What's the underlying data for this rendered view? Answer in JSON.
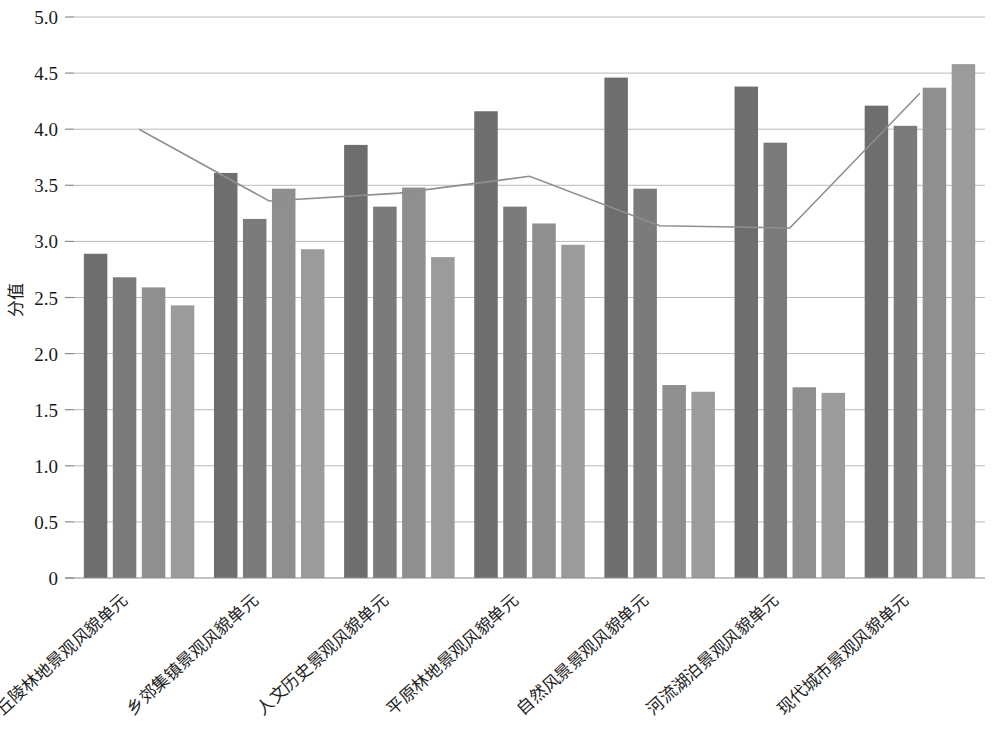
{
  "chart_data": {
    "type": "bar",
    "title": "",
    "subtitle": "",
    "xlabel": "",
    "ylabel": "分值",
    "ylim": [
      0,
      5.0
    ],
    "y_ticks": [
      "0",
      "0.5",
      "1.0",
      "1.5",
      "2.0",
      "2.5",
      "3.0",
      "3.5",
      "4.0",
      "4.5",
      "5.0"
    ],
    "y_tick_values": [
      0,
      0.5,
      1.0,
      1.5,
      2.0,
      2.5,
      3.0,
      3.5,
      4.0,
      4.5,
      5.0
    ],
    "grid": true,
    "legend_position": "none",
    "categories": [
      "丘陵林地景观风貌单元",
      "乡郊集镇景观风貌单元",
      "人文历史景观风貌单元",
      "平原林地景观风貌单元",
      "自然风景景观风貌单元",
      "河流湖泊景观风貌单元",
      "现代城市景观风貌单元"
    ],
    "series": [
      {
        "name": "系列1",
        "color": "#6e6e6e",
        "values": [
          2.89,
          3.61,
          3.86,
          4.16,
          4.46,
          4.38,
          4.21
        ]
      },
      {
        "name": "系列2",
        "color": "#7b7b7b",
        "values": [
          2.68,
          3.2,
          3.31,
          3.31,
          3.47,
          3.88,
          4.03
        ]
      },
      {
        "name": "系列3",
        "color": "#8f8f8f",
        "values": [
          2.59,
          3.47,
          3.48,
          3.16,
          1.72,
          1.7,
          4.37
        ]
      },
      {
        "name": "系列4",
        "color": "#9b9b9b",
        "values": [
          2.43,
          2.93,
          2.86,
          2.97,
          1.66,
          1.65,
          4.58
        ]
      }
    ],
    "line_series": {
      "name": "趋势线",
      "color": "#8f8f8f",
      "values": [
        4.0,
        3.36,
        3.43,
        3.58,
        3.14,
        3.12,
        4.32
      ]
    }
  }
}
